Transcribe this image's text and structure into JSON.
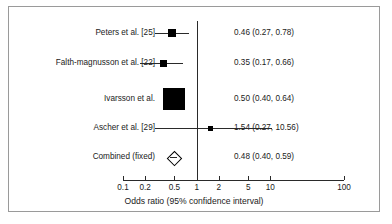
{
  "chart_data": {
    "type": "forest",
    "title": "",
    "xlabel": "Odds ratio (95% confidence interval)",
    "ylabel": "",
    "xscale": "log",
    "xlim": [
      0.1,
      100
    ],
    "null_value": 1,
    "grid": false,
    "legend": "none",
    "tick_values": [
      0.1,
      0.2,
      0.5,
      1,
      2,
      5,
      10,
      100
    ],
    "tick_labels": [
      "0.1",
      "0.2",
      "0.5",
      "1",
      "2",
      "5",
      "10",
      "100"
    ],
    "studies": [
      {
        "label": "Peters et al. [25]",
        "estimate": 0.46,
        "ci_low": 0.27,
        "ci_high": 0.78,
        "stat_text": "0.46 (0.27, 0.78)",
        "marker": "square",
        "weight_px": 8
      },
      {
        "label": "Falth-magnusson et al. [22]",
        "estimate": 0.35,
        "ci_low": 0.17,
        "ci_high": 0.66,
        "stat_text": "0.35 (0.17, 0.66)",
        "marker": "square",
        "weight_px": 7
      },
      {
        "label": "Ivarsson et al.",
        "estimate": 0.5,
        "ci_low": 0.4,
        "ci_high": 0.64,
        "stat_text": "0.50 (0.40, 0.64)",
        "marker": "square",
        "weight_px": 22
      },
      {
        "label": "Ascher et al. [29]",
        "estimate": 1.54,
        "ci_low": 0.27,
        "ci_high": 10.56,
        "stat_text": "1.54 (0.27, 10.56)",
        "marker": "square",
        "weight_px": 5
      },
      {
        "label": "Combined (fixed)",
        "estimate": 0.48,
        "ci_low": 0.4,
        "ci_high": 0.59,
        "stat_text": "0.48 (0.40, 0.59)",
        "marker": "diamond",
        "weight_px": 0
      }
    ]
  },
  "figure": {
    "axis_title": "Odds ratio (95% confidence interval)",
    "border_color": "#9a9a9a",
    "line_color": "#2a2a2a",
    "marker_color": "#000000",
    "text_color": "#1a1a1a"
  }
}
